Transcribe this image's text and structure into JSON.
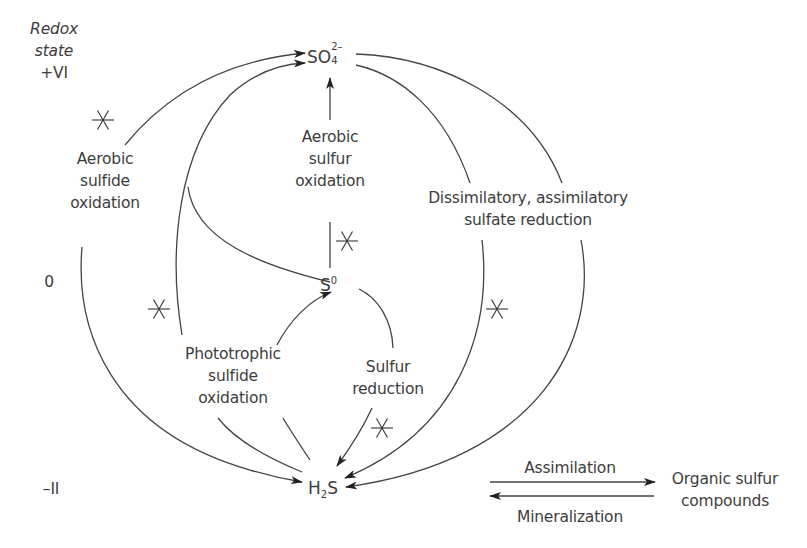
{
  "redox_axis": {
    "title_line1": "Redox",
    "title_line2": "state",
    "levels": [
      {
        "label": "+VI",
        "y": 68
      },
      {
        "label": "0",
        "y": 282
      },
      {
        "label": "–II",
        "y": 488
      }
    ]
  },
  "species": {
    "sulfate": {
      "base": "SO",
      "subscript": "4",
      "superscript": "2–"
    },
    "elemental_sulfur": {
      "base": "S",
      "superscript": "0"
    },
    "hydrogen_sulfide": {
      "base": "H",
      "subscript": "2",
      "tail": "S"
    },
    "organic": {
      "line1": "Organic sulfur",
      "line2": "compounds"
    }
  },
  "processes": {
    "aerobic_sulfide_oxidation": {
      "line1": "Aerobic",
      "line2": "sulfide",
      "line3": "oxidation"
    },
    "aerobic_sulfur_oxidation": {
      "line1": "Aerobic",
      "line2": "sulfur",
      "line3": "oxidation"
    },
    "sulfate_reduction": {
      "line1": "Dissimilatory, assimilatory",
      "line2": "sulfate reduction"
    },
    "phototrophic_sulfide_oxidation": {
      "line1": "Phototrophic",
      "line2": "sulfide",
      "line3": "oxidation"
    },
    "sulfur_reduction": {
      "line1": "Sulfur",
      "line2": "reduction"
    },
    "assimilation": {
      "label": "Assimilation"
    },
    "mineralization": {
      "label": "Mineralization"
    }
  },
  "markers": {
    "asterisk_icon": "asterisk-marker",
    "positions": [
      {
        "x": 103,
        "y": 120
      },
      {
        "x": 347,
        "y": 240
      },
      {
        "x": 159,
        "y": 310
      },
      {
        "x": 497,
        "y": 310
      },
      {
        "x": 382,
        "y": 428
      }
    ]
  },
  "colors": {
    "line": "#444444",
    "text": "#3d3d3d",
    "background": "#ffffff"
  }
}
